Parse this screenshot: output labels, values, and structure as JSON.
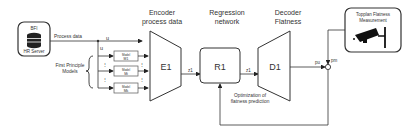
{
  "server": {
    "top": "BFI",
    "bottom": "HR Server"
  },
  "process_data_label": "Process data",
  "u_label": "u",
  "fpm_label_line1": "First Principle",
  "fpm_label_line2": "Models",
  "models": [
    {
      "title": "Model",
      "sub": "M1"
    },
    {
      "title": "Model",
      "sub": "Mi"
    },
    {
      "title": "Model",
      "sub": "Mk"
    }
  ],
  "encoder": {
    "title_line1": "Encoder",
    "title_line2": "process data",
    "label": "E1",
    "out": "z1"
  },
  "regression": {
    "title_line1": "Regression",
    "title_line2": "network",
    "label": "R1",
    "out": "z1"
  },
  "decoder": {
    "title_line1": "Decoder",
    "title_line2": "Flatness",
    "label": "D1",
    "out": "pu"
  },
  "measurement": {
    "line1": "Topplan Flatness",
    "line2": "Measurement",
    "out": "pm"
  },
  "feedback_label_line1": "Optimization of",
  "feedback_label_line2": "flatness prediction"
}
